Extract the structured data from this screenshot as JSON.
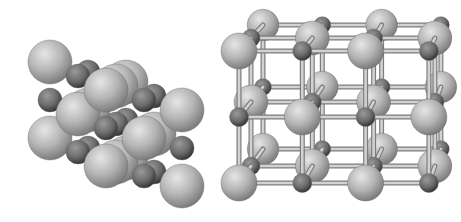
{
  "figure": {
    "title": "",
    "panels": [
      {
        "id": "space-filling",
        "label": "",
        "description": "space-filling model of rock-salt crystal lattice"
      },
      {
        "id": "ball-and-stick",
        "label": "",
        "description": "ball-and-stick model of rock-salt crystal lattice"
      }
    ]
  },
  "colors": {
    "large_ion": "#b4b4b4",
    "small_ion": "#6a6a6a",
    "bond": "#c8c8c8",
    "background": "#ffffff"
  }
}
